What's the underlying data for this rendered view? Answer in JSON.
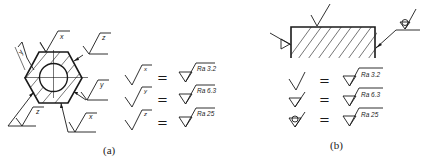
{
  "figure_a": {
    "caption": "(a)",
    "part_labels": {
      "top": "x",
      "top_right": "z",
      "left": "y",
      "right": "y",
      "bottom_left": "z",
      "bottom_right": "x"
    },
    "legend": [
      {
        "symbol_letter": "x",
        "equals": "=",
        "value": "Ra 3.2"
      },
      {
        "symbol_letter": "y",
        "equals": "=",
        "value": "Ra 6.3"
      },
      {
        "symbol_letter": "z",
        "equals": "=",
        "value": "Ra 25"
      }
    ]
  },
  "figure_b": {
    "caption": "(b)",
    "legend": [
      {
        "symbol": "plain-check",
        "equals": "=",
        "value": "Ra 3.2"
      },
      {
        "symbol": "triangle-check",
        "equals": "=",
        "value": "Ra 6.3"
      },
      {
        "symbol": "circle-triangle-check",
        "equals": "=",
        "value": "Ra 25"
      }
    ]
  }
}
